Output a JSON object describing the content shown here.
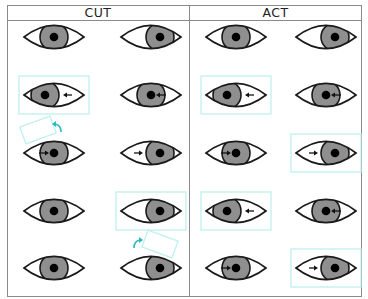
{
  "columns": [
    {
      "id": "cut",
      "label": "CUT"
    },
    {
      "id": "act",
      "label": "ACT"
    }
  ],
  "colors": {
    "outline": "#1a1a1a",
    "iris": "#8f8f8f",
    "pupil": "#000000",
    "sclera": "#ffffff",
    "highlight_box": "#bff0f0",
    "curved_arrow": "#2bb8c0",
    "frame": "#8a8a8a"
  },
  "grid": {
    "column_centers_x": [
      54,
      151,
      236,
      326
    ],
    "row_centers_y": [
      37,
      95,
      153,
      211,
      268
    ]
  },
  "eyes": [
    {
      "col": 0,
      "row": 0,
      "iris": "center",
      "arrow": "none",
      "boxed": false
    },
    {
      "col": 1,
      "row": 0,
      "iris": "right",
      "arrow": "none",
      "boxed": false
    },
    {
      "col": 0,
      "row": 1,
      "iris": "left",
      "arrow": "left",
      "boxed": true
    },
    {
      "col": 1,
      "row": 1,
      "iris": "center",
      "arrow": "left",
      "boxed": false
    },
    {
      "col": 0,
      "row": 2,
      "iris": "center",
      "arrow": "right",
      "boxed": false
    },
    {
      "col": 1,
      "row": 2,
      "iris": "right",
      "arrow": "right",
      "boxed": false
    },
    {
      "col": 0,
      "row": 3,
      "iris": "center",
      "arrow": "none",
      "boxed": false
    },
    {
      "col": 1,
      "row": 3,
      "iris": "right",
      "arrow": "none",
      "boxed": true
    },
    {
      "col": 0,
      "row": 4,
      "iris": "center",
      "arrow": "none",
      "boxed": false
    },
    {
      "col": 1,
      "row": 4,
      "iris": "right",
      "arrow": "none",
      "boxed": false
    },
    {
      "col": 2,
      "row": 0,
      "iris": "center",
      "arrow": "none",
      "boxed": false
    },
    {
      "col": 3,
      "row": 0,
      "iris": "right",
      "arrow": "none",
      "boxed": false
    },
    {
      "col": 2,
      "row": 1,
      "iris": "left",
      "arrow": "left",
      "boxed": true
    },
    {
      "col": 3,
      "row": 1,
      "iris": "center",
      "arrow": "left",
      "boxed": false
    },
    {
      "col": 2,
      "row": 2,
      "iris": "center",
      "arrow": "right",
      "boxed": false
    },
    {
      "col": 3,
      "row": 2,
      "iris": "right",
      "arrow": "right",
      "boxed": true
    },
    {
      "col": 2,
      "row": 3,
      "iris": "left",
      "arrow": "left",
      "boxed": true
    },
    {
      "col": 3,
      "row": 3,
      "iris": "center",
      "arrow": "left",
      "boxed": false
    },
    {
      "col": 2,
      "row": 4,
      "iris": "center",
      "arrow": "right",
      "boxed": false
    },
    {
      "col": 3,
      "row": 4,
      "iris": "right",
      "arrow": "right",
      "boxed": true
    }
  ],
  "tilted_boxes": [
    {
      "cx": 38,
      "cy": 130,
      "angle": -20,
      "arrow_x": 58,
      "arrow_y": 128,
      "arrow_dir": "up-left"
    },
    {
      "cx": 160,
      "cy": 244,
      "angle": 20,
      "arrow_x": 137,
      "arrow_y": 244,
      "arrow_dir": "up-right"
    }
  ]
}
